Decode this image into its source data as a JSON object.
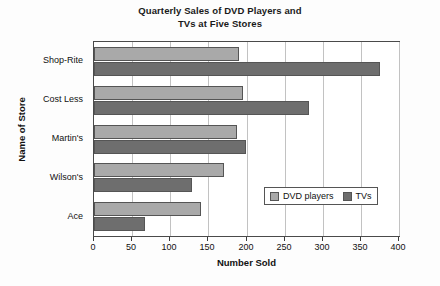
{
  "chart_data": {
    "type": "bar",
    "orientation": "horizontal",
    "title": "Quarterly Sales of DVD Players and TVs at Five Stores",
    "title_line1": "Quarterly Sales of DVD Players and",
    "title_line2": "TVs at Five Stores",
    "xlabel": "Number Sold",
    "ylabel": "Name of Store",
    "categories": [
      "Ace",
      "Wilson's",
      "Martin's",
      "Cost Less",
      "Shop-Rite"
    ],
    "series": [
      {
        "name": "DVD players",
        "color": "#a9a9a9",
        "values": [
          140,
          170,
          187,
          195,
          190
        ]
      },
      {
        "name": "TVs",
        "color": "#6e6e6e",
        "values": [
          67,
          129,
          199,
          282,
          375
        ]
      }
    ],
    "xlim": [
      0,
      400
    ],
    "xticks": [
      0,
      50,
      100,
      150,
      200,
      250,
      300,
      350,
      400
    ],
    "xtick_labels": [
      "0",
      "50",
      "100",
      "150",
      "200",
      "250",
      "300",
      "350",
      "400"
    ],
    "grid": "vertical",
    "legend_position": "center-right-inside"
  }
}
